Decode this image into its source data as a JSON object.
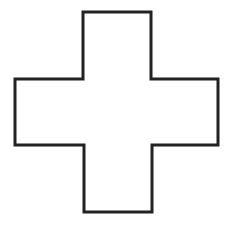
{
  "diagram": {
    "shape": "cross",
    "stroke_color": "#222222",
    "fill_color": "#ffffff",
    "background": "#ffffff",
    "stroke_width": 3,
    "points": "83,12 151,12 151,79 218,79 218,145 152,145 152,212 84,212 84,145 15,145 15,79 83,79"
  }
}
